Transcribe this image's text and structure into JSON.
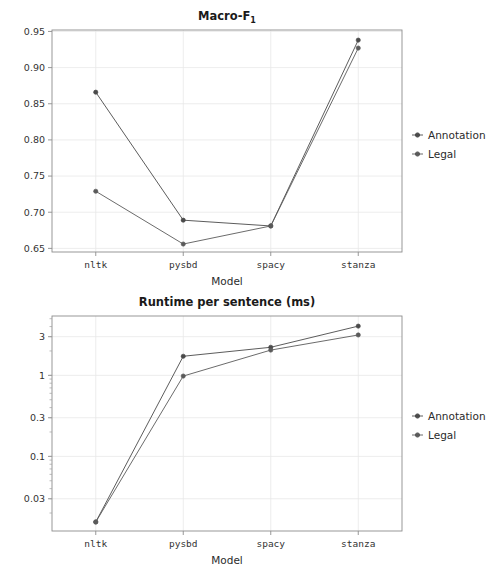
{
  "figure": {
    "width": 501,
    "height": 569,
    "background": "#ffffff"
  },
  "colors": {
    "annotation": "#4a4a4a",
    "legal": "#5a5a5a",
    "grid": "#e9e9e9",
    "spine": "#8d8d8d",
    "text": "#2b2b2b"
  },
  "chart_data": [
    {
      "id": "macro-f1",
      "type": "line",
      "title": "Macro-F₁",
      "title_main": "Macro-F",
      "title_sub": "1",
      "xlabel": "Model",
      "ylabel": "",
      "categories": [
        "nltk",
        "pysbd",
        "spacy",
        "stanza"
      ],
      "yscale": "linear",
      "ylim": [
        0.645,
        0.952
      ],
      "yticks": [
        0.65,
        0.7,
        0.75,
        0.8,
        0.85,
        0.9,
        0.95
      ],
      "ytick_labels": [
        "0.65",
        "0.70",
        "0.75",
        "0.80",
        "0.85",
        "0.90",
        "0.95"
      ],
      "grid": true,
      "legend_position": "right",
      "series": [
        {
          "name": "Annotation",
          "values": [
            0.866,
            0.689,
            0.681,
            0.938
          ],
          "color": "#4a4a4a"
        },
        {
          "name": "Legal",
          "values": [
            0.729,
            0.656,
            0.681,
            0.927
          ],
          "color": "#5a5a5a"
        }
      ]
    },
    {
      "id": "runtime-per-sentence",
      "type": "line",
      "title": "Runtime per sentence (ms)",
      "xlabel": "Model",
      "ylabel": "",
      "categories": [
        "nltk",
        "pysbd",
        "spacy",
        "stanza"
      ],
      "yscale": "log",
      "ylim": [
        0.012,
        5.4
      ],
      "yticks": [
        0.03,
        0.1,
        0.3,
        1,
        3
      ],
      "ytick_labels": [
        "0.03",
        "0.1",
        "0.3",
        "1",
        "3"
      ],
      "grid": true,
      "legend_position": "right",
      "series": [
        {
          "name": "Annotation",
          "values": [
            0.0155,
            1.72,
            2.22,
            4.05
          ],
          "color": "#4a4a4a"
        },
        {
          "name": "Legal",
          "values": [
            0.0155,
            0.98,
            2.05,
            3.15
          ],
          "color": "#5a5a5a"
        }
      ]
    }
  ],
  "legend": {
    "top": {
      "entries": [
        {
          "label": "Annotation",
          "color": "#4a4a4a"
        },
        {
          "label": "Legal",
          "color": "#5a5a5a"
        }
      ]
    },
    "bottom": {
      "entries": [
        {
          "label": "Annotation",
          "color": "#4a4a4a"
        },
        {
          "label": "Legal",
          "color": "#5a5a5a"
        }
      ]
    }
  }
}
